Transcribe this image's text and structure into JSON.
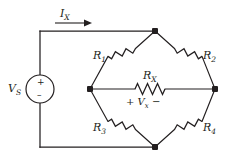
{
  "figure": {
    "name": "wheatstone-bridge-circuit",
    "background_color": "#ffffff",
    "line_color": "#231f20"
  },
  "source": {
    "label": "V",
    "label_sub": "S",
    "plus_sign": "+",
    "minus_sign": "–",
    "symbol": "independent-voltage-source"
  },
  "current": {
    "label": "I",
    "label_sub": "X",
    "direction": "right"
  },
  "resistors": [
    {
      "id": "r1",
      "label": "R",
      "label_sub": "1",
      "position": "upper-left-diagonal"
    },
    {
      "id": "r2",
      "label": "R",
      "label_sub": "2",
      "position": "upper-right-diagonal"
    },
    {
      "id": "r3",
      "label": "R",
      "label_sub": "3",
      "position": "lower-left-diagonal"
    },
    {
      "id": "r4",
      "label": "R",
      "label_sub": "4",
      "position": "lower-right-diagonal"
    },
    {
      "id": "rx",
      "label": "R",
      "label_sub": "X",
      "position": "bridge-center-horizontal"
    }
  ],
  "bridge_voltage": {
    "plus": "+",
    "label": "V",
    "label_sub": "x",
    "minus": "−"
  },
  "nodes": [
    {
      "id": "node-top",
      "x": 155,
      "y": 31
    },
    {
      "id": "node-left",
      "x": 90,
      "y": 89
    },
    {
      "id": "node-right",
      "x": 215,
      "y": 89
    },
    {
      "id": "node-bottom",
      "x": 155,
      "y": 147
    }
  ]
}
